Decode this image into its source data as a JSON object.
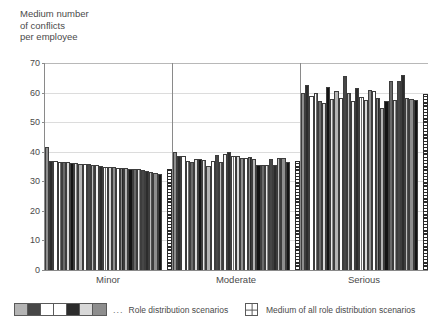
{
  "chart_data": {
    "type": "bar",
    "title": "",
    "ylabel": "Medium number\nof conflicts\nper employee",
    "xlabel": "",
    "ylim": [
      0,
      70
    ],
    "yticks": [
      0,
      10,
      20,
      30,
      40,
      50,
      60,
      70
    ],
    "grid": true,
    "legend_position": "bottom",
    "categories": [
      "Minor",
      "Moderate",
      "Serious"
    ],
    "groups": [
      {
        "name": "Minor",
        "scenario_values": [
          41.5,
          37.0,
          36.8,
          36.6,
          36.5,
          36.4,
          36.3,
          36.2,
          36.0,
          35.8,
          35.7,
          35.6,
          35.4,
          35.2,
          35.0,
          34.9,
          34.8,
          34.6,
          34.5,
          34.4,
          34.3,
          34.2,
          34.0,
          33.8,
          33.6,
          33.2,
          32.8,
          32.4
        ],
        "medium_value": 34.0
      },
      {
        "name": "Moderate",
        "scenario_values": [
          39.8,
          38.6,
          38.4,
          36.8,
          36.6,
          37.4,
          37.6,
          37.2,
          35.2,
          36.8,
          38.8,
          36.4,
          39.4,
          40.0,
          38.6,
          38.4,
          37.8,
          38.0,
          38.2,
          37.4,
          35.6,
          35.4,
          35.4,
          37.6,
          35.6,
          37.8,
          37.8,
          36.6
        ],
        "medium_value": 37.0
      },
      {
        "name": "Serious",
        "scenario_values": [
          59.8,
          62.5,
          59.0,
          60.0,
          57.0,
          56.6,
          62.0,
          57.8,
          60.4,
          58.2,
          65.6,
          60.0,
          57.0,
          61.6,
          58.6,
          57.4,
          61.0,
          60.6,
          58.2,
          54.8,
          57.0,
          64.0,
          57.4,
          64.0,
          66.0,
          58.2,
          58.0,
          57.4
        ],
        "medium_value": 59.6
      }
    ],
    "legend": [
      {
        "label": "Role distribution scenarios",
        "marker": "pattern-swatches",
        "ellipsis": "..."
      },
      {
        "label": "Medium of all role distribution scenarios",
        "marker": "grid-swatch"
      }
    ],
    "colors": {
      "axis": "#8a8a8a",
      "gridline": "#dcdcdc",
      "text": "#4a4a4a",
      "bar_outline": "#3d3d3d",
      "background": "#ffffff"
    }
  }
}
